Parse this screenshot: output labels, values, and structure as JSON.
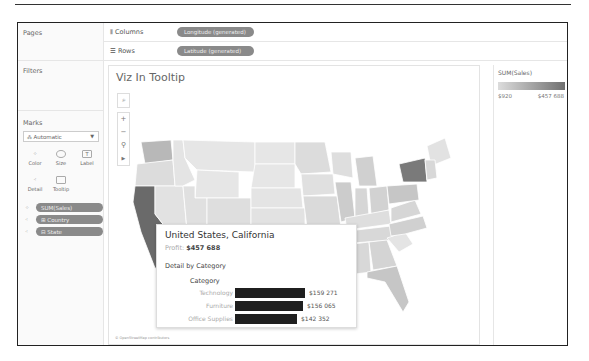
{
  "left_panel": {
    "pages_label": "Pages",
    "filters_label": "Filters",
    "marks_label": "Marks",
    "mark_type": "Automatic",
    "mark_buttons": [
      {
        "label": "Color",
        "icon": "color-icon"
      },
      {
        "label": "Size",
        "icon": "size-icon"
      },
      {
        "label": "Label",
        "icon": "label-icon"
      },
      {
        "label": "Detail",
        "icon": "detail-icon"
      },
      {
        "label": "Tooltip",
        "icon": "tooltip-icon"
      }
    ],
    "mark_pills": [
      {
        "label": "SUM(Sales)",
        "icon": "color-icon"
      },
      {
        "label": "Country",
        "icon": "detail-icon"
      },
      {
        "label": "State",
        "icon": "detail-icon"
      }
    ]
  },
  "shelves": {
    "columns_label": "Columns",
    "columns_pill": "Longitude (generated)",
    "rows_label": "Rows",
    "rows_pill": "Latitude (generated)"
  },
  "viz": {
    "title": "Viz In Tooltip",
    "attribution": "© OpenStreetMap contributors"
  },
  "legend": {
    "title": "SUM(Sales)",
    "min": "$920",
    "max": "$457 688",
    "color_low": "#dcdcdc",
    "color_high": "#707070"
  },
  "tooltip": {
    "title": "United States, California",
    "profit_label": "Profit:",
    "profit_value": "$457 688",
    "detail_heading": "Detail by Category",
    "category_header": "Category",
    "rows": [
      {
        "category": "Technology",
        "value": "$159 271",
        "amount": 159271
      },
      {
        "category": "Furniture",
        "value": "$156 065",
        "amount": 156065
      },
      {
        "category": "Office Supplies",
        "value": "$142 352",
        "amount": 142352
      }
    ]
  }
}
